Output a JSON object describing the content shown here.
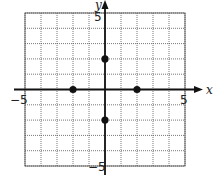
{
  "chart_data": {
    "type": "scatter",
    "title": "",
    "xlabel": "x",
    "ylabel": "y",
    "xlim": [
      -5,
      5
    ],
    "ylim": [
      -5,
      5
    ],
    "grid": true,
    "grid_step": 1,
    "tick_labels": {
      "x_min": "−5",
      "x_max": "5",
      "y_max": "5",
      "y_min": "−5"
    },
    "points": [
      {
        "x": -2,
        "y": 0
      },
      {
        "x": 2,
        "y": 0
      },
      {
        "x": 0,
        "y": 2
      },
      {
        "x": 0,
        "y": -2
      }
    ],
    "colors": {
      "axis": "#111111",
      "grid": "#555555",
      "point": "#111111"
    }
  }
}
